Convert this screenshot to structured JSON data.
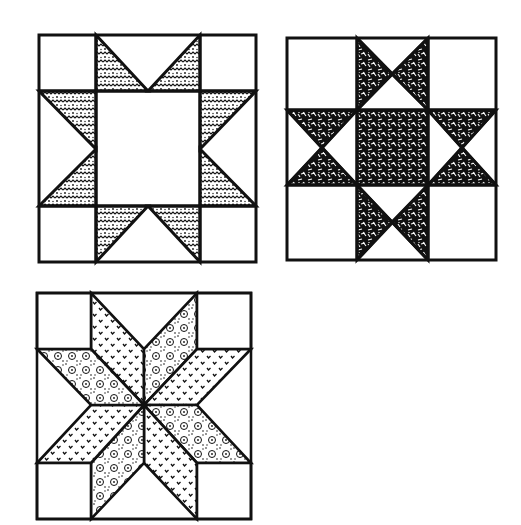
{
  "figure": {
    "background": "#ffffff",
    "ink": "#111111",
    "blocks": [
      {
        "name": "sawtooth-star-block",
        "pattern": "chevron-speckle",
        "layout": "3x3 grid with large open center square and 8 star-point triangles"
      },
      {
        "name": "ohio-star-block",
        "pattern": "dense-hatched",
        "layout": "3x3 grid with hatched center and quarter-square star points"
      },
      {
        "name": "eight-point-star-block",
        "pattern": "alternating v-marks and floral print",
        "layout": "8 diamond star points with 4 corner squares"
      }
    ]
  }
}
